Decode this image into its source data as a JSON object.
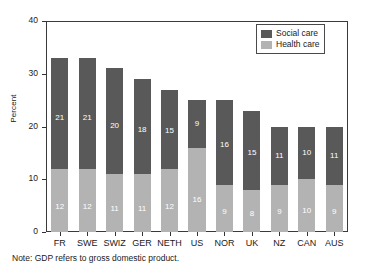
{
  "chart_data": {
    "type": "bar",
    "stacked": true,
    "title": "",
    "subtitle": "",
    "xlabel": "",
    "ylabel": "Percent",
    "ylim": [
      0,
      40
    ],
    "yticks": [
      0,
      10,
      20,
      30,
      40
    ],
    "ytick_labels": [
      "0",
      "10",
      "20",
      "30",
      "40"
    ],
    "grid": false,
    "legend_position": "top-right",
    "categories": [
      "FR",
      "SWE",
      "SWIZ",
      "GER",
      "NETH",
      "US",
      "NOR",
      "UK",
      "NZ",
      "CAN",
      "AUS"
    ],
    "series": [
      {
        "name": "Health care",
        "color": "#b3b3b3",
        "values": [
          12,
          12,
          11,
          11,
          12,
          16,
          9,
          8,
          9,
          10,
          9
        ]
      },
      {
        "name": "Social care",
        "color": "#595959",
        "values": [
          21,
          21,
          20,
          18,
          15,
          9,
          16,
          15,
          11,
          10,
          11
        ]
      }
    ],
    "totals": [
      33,
      33,
      31,
      29,
      27,
      25,
      25,
      23,
      20,
      20,
      20
    ],
    "annotations": [
      "Note: GDP refers to gross domestic product."
    ]
  },
  "legend": {
    "entries": [
      {
        "label": "Social care",
        "color": "#595959"
      },
      {
        "label": "Health care",
        "color": "#b3b3b3"
      }
    ]
  },
  "note": {
    "text": "Note: GDP refers to gross domestic product."
  },
  "colors": {
    "social_care": "#595959",
    "health_care": "#b3b3b3",
    "axis": "#3a3a3a",
    "background": "#ffffff",
    "value_label": "#ffffff"
  }
}
